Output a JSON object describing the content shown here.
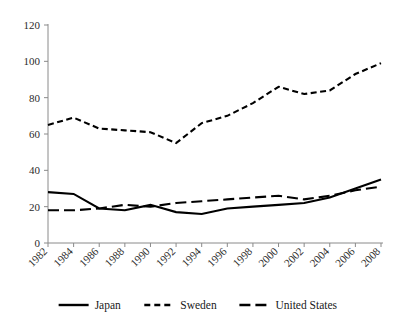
{
  "chart_data": {
    "type": "line",
    "title": "",
    "xlabel": "",
    "ylabel": "",
    "x": [
      1982,
      1984,
      1986,
      1988,
      1990,
      1992,
      1994,
      1996,
      1998,
      2000,
      2002,
      2004,
      2006,
      2008
    ],
    "categories": [
      "1982",
      "1984",
      "1986",
      "1988",
      "1990",
      "1992",
      "1994",
      "1996",
      "1998",
      "2000",
      "2002",
      "2004",
      "2006",
      "2008"
    ],
    "xlim": [
      1982,
      2008
    ],
    "ylim": [
      0,
      120
    ],
    "yticks": [
      0,
      20,
      40,
      60,
      80,
      100,
      120
    ],
    "ytick_labels": [
      "0",
      "20",
      "40",
      "60",
      "80",
      "100",
      "120"
    ],
    "grid": false,
    "legend_position": "bottom",
    "series": [
      {
        "name": "Japan",
        "style": "solid",
        "color": "#000000",
        "values": [
          28,
          27,
          19,
          18,
          21,
          17,
          16,
          19,
          20,
          21,
          22,
          25,
          30,
          35
        ]
      },
      {
        "name": "Sweden",
        "style": "dashed-short",
        "color": "#000000",
        "values": [
          65,
          69,
          63,
          62,
          61,
          55,
          66,
          70,
          77,
          86,
          82,
          84,
          93,
          99
        ]
      },
      {
        "name": "United States",
        "style": "dashed-long",
        "color": "#000000",
        "values": [
          18,
          18,
          19,
          21,
          20,
          22,
          23,
          24,
          25,
          26,
          24,
          26,
          29,
          31
        ]
      }
    ]
  },
  "legend": {
    "items": [
      {
        "label": "Japan",
        "style": "solid"
      },
      {
        "label": "Sweden",
        "style": "dashed-short"
      },
      {
        "label": "United States",
        "style": "dashed-long"
      }
    ]
  }
}
